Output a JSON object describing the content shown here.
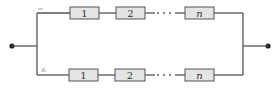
{
  "diagram": {
    "type": "parallel-series reliability block diagram",
    "branches": [
      {
        "name": "top",
        "mark": "—",
        "blocks": [
          {
            "label": "1"
          },
          {
            "label": "2"
          },
          {
            "label": "n"
          }
        ]
      },
      {
        "name": "bottom",
        "mark": "≏",
        "blocks": [
          {
            "label": "1"
          },
          {
            "label": "2"
          },
          {
            "label": "n"
          }
        ]
      }
    ],
    "ellipsis": "····",
    "nodes": [
      "input",
      "output"
    ]
  },
  "colors": {
    "line": "#555555",
    "block_fill": "#e4e4e4"
  }
}
